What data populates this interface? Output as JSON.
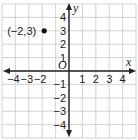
{
  "chart_data": {
    "type": "scatter",
    "title": "",
    "xlabel": "x",
    "ylabel": "y",
    "origin_label": "O",
    "xlim": [
      -5,
      5
    ],
    "ylim": [
      -5,
      5
    ],
    "grid": true,
    "x_ticks": [
      -4,
      -3,
      -2,
      1,
      2,
      3,
      4
    ],
    "x_tick_labels": [
      "−4",
      "−3",
      "−2",
      "1",
      "2",
      "3",
      "4"
    ],
    "y_ticks": [
      4,
      3,
      2,
      1,
      -1,
      -2,
      -3,
      -4
    ],
    "y_tick_labels": [
      "4",
      "3",
      "2",
      "1",
      "−1",
      "−2",
      "−3",
      "−4"
    ],
    "points": [
      {
        "x": -2,
        "y": 3,
        "label": "(−2,3)"
      }
    ],
    "colors": {
      "grid": "#c8c8c8",
      "axis": "#222222",
      "point": "#111111"
    }
  }
}
